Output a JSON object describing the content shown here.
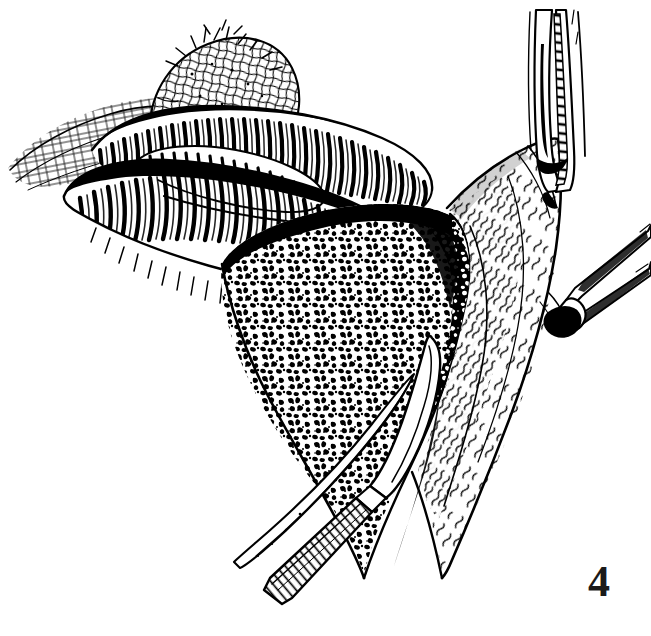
{
  "figure": {
    "number_label": "4",
    "caption": "",
    "title": "Surgical line-art illustration: bowel loop retracted with mesenteric fat exposed, scalpel incising tissue, two forceps on right-hand flap",
    "style": "black ink line engraving / pen-and-ink hatching",
    "background_color": "#ffffff",
    "ink_color": "#000000",
    "label_color": "#1a1a1a",
    "canvas": {
      "width": 651,
      "height": 636
    }
  },
  "anatomy": {
    "bowel_loop": {
      "name": "bowel-loop",
      "description": "Coiled small-intestine loop, upper left, rendered with dense transverse rib hatching",
      "texture": "transverse-rib-hatching"
    },
    "mass": {
      "name": "tissue-mass",
      "description": "Rounded mass / nodule above and behind the bowel loop, cross-hatched mesh texture",
      "texture": "cross-hatch-mesh"
    },
    "fat_pad": {
      "name": "mesenteric-fat",
      "description": "Central wedge of granular mesenteric / omental fat, stippled blotch texture",
      "texture": "granular-stipple"
    },
    "fascial_flap": {
      "name": "fascial-flap",
      "description": "Right-hand retracted fascia / peritoneal flap with wavy squiggle striations",
      "texture": "wavy-squiggle"
    },
    "left_membrane": {
      "name": "left-membrane",
      "description": "Thin membrane sheet at far left drawn with faint grid hatch",
      "texture": "faint-grid"
    }
  },
  "instruments": [
    {
      "name": "upper-forceps",
      "label": "hemostatic clamp",
      "position": "top-right",
      "description": "Long straight clamp with serrated jaw entering from top, gripping the flap edge"
    },
    {
      "name": "lower-forceps",
      "label": "tissue forceps",
      "position": "middle-right",
      "description": "Fine-tipped forceps entering from right, tenting the flap edge"
    },
    {
      "name": "scalpel",
      "label": "scalpel",
      "position": "center-bottom",
      "description": "Scalpel with knurled ribbed handle and pointed blade incising the fat plane"
    }
  ],
  "colors": {
    "ink": "#000000",
    "paper": "#ffffff",
    "label": "#1a1a1a"
  }
}
